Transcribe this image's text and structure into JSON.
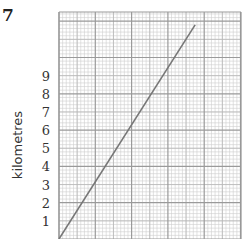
{
  "question_number": "7",
  "chart_data": {
    "type": "line",
    "title": "",
    "xlabel": "",
    "ylabel": "kilometres",
    "y_tick_labels": [
      "1",
      "2",
      "3",
      "4",
      "5",
      "6",
      "7",
      "8",
      "9"
    ],
    "y_ticks": [
      1,
      2,
      3,
      4,
      5,
      6,
      7,
      8,
      9
    ],
    "ylim": [
      0,
      12.1
    ],
    "x_tick_labels": [],
    "grid": true,
    "grid_style": "graph paper: major squares each 2 km tall, subdivided into 10x10 fine squares",
    "series": [
      {
        "name": "distance",
        "x_major_squares": [
          0,
          3.75
        ],
        "y": [
          0,
          11.8
        ]
      }
    ],
    "colors": {
      "line": "#777777",
      "major_grid": "#9a9a9a",
      "minor_grid": "#cfcfcf",
      "text": "#333333"
    }
  }
}
